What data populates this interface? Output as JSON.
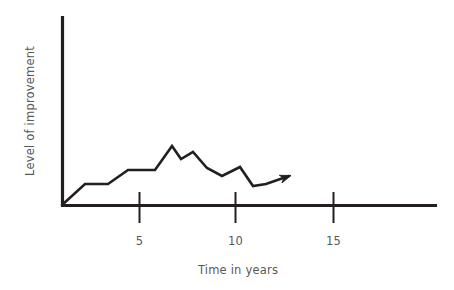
{
  "chart_data": {
    "type": "line",
    "title": "",
    "subtitle": "",
    "xlabel": "Time in years",
    "ylabel": "Level of improvement",
    "xlim": [
      0,
      25
    ],
    "ylim": [
      0,
      10
    ],
    "grid": false,
    "legend": null,
    "style": "hand-drawn sketch",
    "xticks": [
      {
        "value": 5,
        "label": "5"
      },
      {
        "value": 10,
        "label": "10"
      },
      {
        "value": 15,
        "label": "15"
      }
    ],
    "yticks": [],
    "annotations": [
      {
        "kind": "arrowhead",
        "at_x": 13.1,
        "at_y": 2.6,
        "note": "line terminates in an arrow pointing up-right"
      }
    ],
    "series": [
      {
        "name": "Level of improvement over time",
        "color": "#231f20",
        "x": [
          0.0,
          1.3,
          2.6,
          3.7,
          5.3,
          6.4,
          6.9,
          7.7,
          8.4,
          9.2,
          10.2,
          10.9,
          11.6,
          13.1
        ],
        "y": [
          0.0,
          2.4,
          2.4,
          4.0,
          4.0,
          6.8,
          5.3,
          6.1,
          4.4,
          3.4,
          4.6,
          2.9,
          3.1,
          3.4
        ],
        "points_px": [
          [
            62,
            205
          ],
          [
            85,
            184
          ],
          [
            108,
            184
          ],
          [
            128,
            170
          ],
          [
            155,
            170
          ],
          [
            172,
            146
          ],
          [
            181,
            159
          ],
          [
            193,
            152
          ],
          [
            207,
            168
          ],
          [
            222,
            176
          ],
          [
            240,
            167
          ],
          [
            253,
            186
          ],
          [
            266,
            184
          ],
          [
            289,
            176
          ]
        ]
      }
    ]
  },
  "axes": {
    "y_axis_label": "Level of improvement",
    "x_axis_label": "Time in years",
    "y_axis_color": "#231f20",
    "x_axis_color": "#231f20",
    "label_color": "#58595b"
  }
}
